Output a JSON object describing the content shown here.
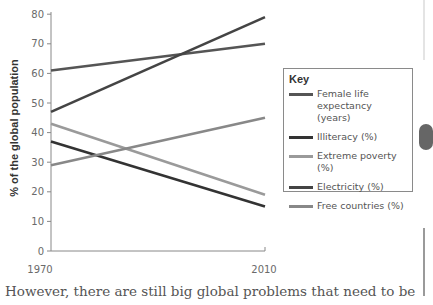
{
  "chart_data": {
    "type": "line",
    "title": "",
    "xlabel": "",
    "ylabel": "% of the global population",
    "x": [
      1970,
      2010
    ],
    "x_tick_labels": [
      "1970",
      "2010"
    ],
    "y_ticks": [
      0,
      10,
      20,
      30,
      40,
      50,
      60,
      70,
      80
    ],
    "ylim": [
      0,
      80
    ],
    "grid": false,
    "legend_title": "Key",
    "legend_position": "right",
    "series": [
      {
        "name": "Female life expectancy (years)",
        "values": [
          61,
          70
        ],
        "color": "#555555"
      },
      {
        "name": "Illiteracy (%)",
        "values": [
          37,
          15
        ],
        "color": "#333333"
      },
      {
        "name": "Extreme poverty (%)",
        "values": [
          43,
          19
        ],
        "color": "#9a9a9a"
      },
      {
        "name": "Electricity (%)",
        "values": [
          47,
          79
        ],
        "color": "#444444"
      },
      {
        "name": "Free countries (%)",
        "values": [
          29,
          45
        ],
        "color": "#888888"
      }
    ]
  },
  "legend": {
    "title": "Key",
    "items": [
      {
        "label": "Female life expectancy (years)",
        "color": "#555555"
      },
      {
        "label": "Illiteracy (%)",
        "color": "#333333"
      },
      {
        "label": "Extreme poverty (%)",
        "color": "#9a9a9a"
      },
      {
        "label": "Electricity (%)",
        "color": "#444444"
      },
      {
        "label": "Free countries (%)",
        "color": "#888888"
      }
    ]
  },
  "axis": {
    "ylabel": "% of the global population",
    "y_ticks": [
      "0",
      "10",
      "20",
      "30",
      "40",
      "50",
      "60",
      "70",
      "80"
    ],
    "x_ticks": [
      "1970",
      "2010"
    ]
  },
  "caption": "However, there are still big global problems that need to be"
}
